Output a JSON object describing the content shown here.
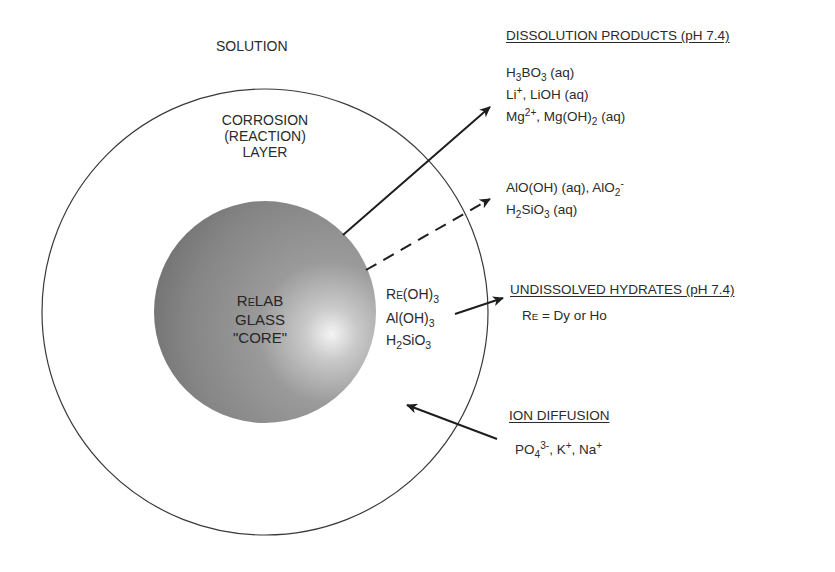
{
  "regions": {
    "solution": "SOLUTION",
    "corrosion_layer": [
      "CORROSION",
      "(REACTION)",
      "LAYER"
    ],
    "core": {
      "line1_prefix_R": "R",
      "line1_small_E": "E",
      "line1_rest": "LAB",
      "line2": "GLASS",
      "line3": "\"CORE\""
    }
  },
  "layer_species": {
    "re_oh3": {
      "r": "R",
      "e": "E",
      "rest": "(OH)",
      "sub": "3"
    },
    "al_oh3": {
      "base": "Al(OH)",
      "sub": "3"
    },
    "h2sio3": {
      "a": "H",
      "sub1": "2",
      "b": "SiO",
      "sub2": "3"
    }
  },
  "dissolution_products": {
    "header": "DISSOLUTION PRODUCTS (pH 7.4)",
    "h3bo3": {
      "a": "H",
      "s1": "3",
      "b": "BO",
      "s2": "3",
      "c": " (aq)"
    },
    "li": {
      "a": "Li",
      "sup": "+",
      "b": ",  LiOH (aq)"
    },
    "mg": {
      "a": "Mg",
      "sup": "2+",
      "b": ",  Mg(OH)",
      "sub": "2",
      "c": " (aq)"
    },
    "alo": {
      "a": "AlO(OH) (aq),  AlO",
      "sub": "2",
      "sup": "-"
    },
    "h2sio3": {
      "a": "H",
      "s1": "2",
      "b": "SiO",
      "s2": "3",
      "c": " (aq)"
    }
  },
  "undissolved_hydrates": {
    "header": "UNDISSOLVED HYDRATES (pH 7.4)",
    "note": {
      "r": "R",
      "e": "E",
      "rest": " = Dy or Ho"
    }
  },
  "ion_diffusion": {
    "header": "ION DIFFUSION",
    "po4": {
      "a": "PO",
      "sub": "4",
      "sup": "3-",
      "b": ", K",
      "sup2": "+",
      "c": ", Na",
      "sup3": "+"
    }
  },
  "colors": {
    "stroke": "#2a2a2a",
    "sphere_dark": "#6e6e6e",
    "sphere_mid": "#8f8f8f",
    "sphere_highlight": "#f2f2f2"
  }
}
